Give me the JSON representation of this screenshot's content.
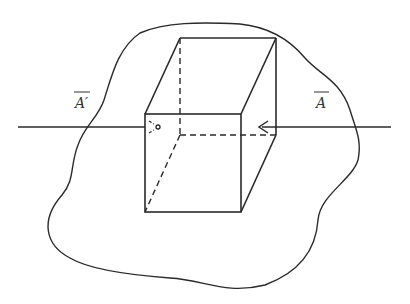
{
  "diagram": {
    "type": "vector-field-flux-illustration",
    "labels": {
      "left_vector": "A′",
      "right_vector": "A"
    },
    "elements": {
      "region_outline": "irregular closed surface (blob)",
      "cube": "rectangular box in perspective with hidden edges dashed",
      "field_line": "horizontal line passing through the box",
      "arrow_right": "arrowhead pointing left, entering right face",
      "arrow_left": "dashed arrowhead pointing right, ending inside at left face with small circle"
    },
    "colors": {
      "line": "#2a2a2a",
      "background": "#ffffff",
      "text": "#333333"
    }
  }
}
